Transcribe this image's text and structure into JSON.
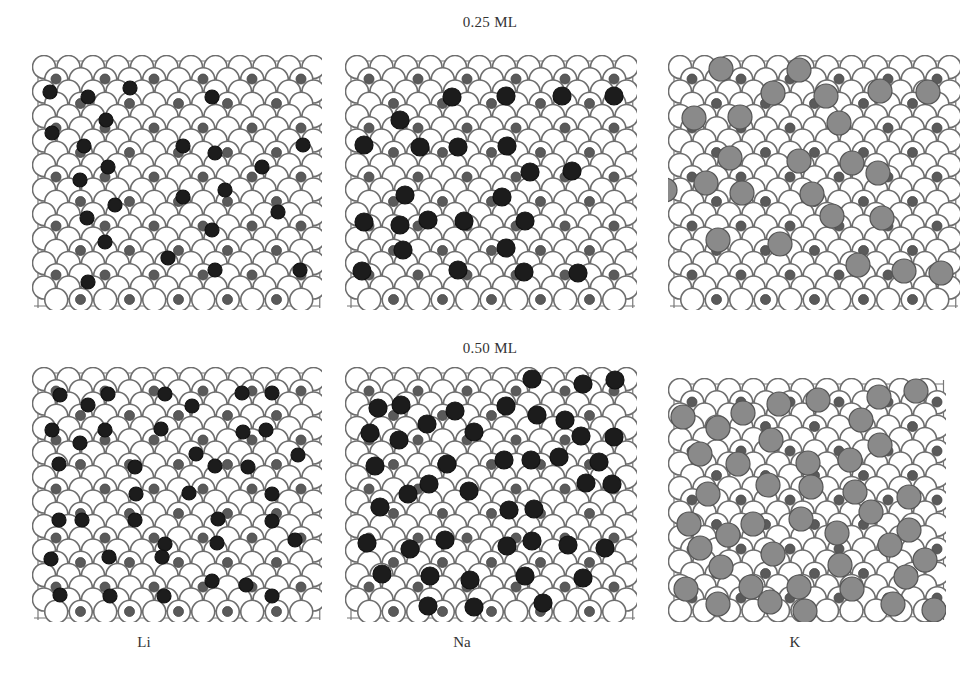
{
  "figure": {
    "rows": [
      {
        "label": "0.25 ML",
        "label_y": 14
      },
      {
        "label": "0.50 ML",
        "label_y": 340
      }
    ],
    "columns": [
      {
        "label": "Li",
        "label_x": 144
      },
      {
        "label": "Na",
        "label_x": 462
      },
      {
        "label": "K",
        "label_x": 795
      }
    ],
    "column_label_y": 634,
    "colors": {
      "substrate_fill": "#ffffff",
      "substrate_stroke": "#6e6e6e",
      "interstitial_fill": "#5a5a5a",
      "li_na_adsorbate": "#1c1c1c",
      "k_adsorbate": "#8a8a8a",
      "k_adsorbate_stroke": "#555555"
    },
    "panels": [
      {
        "id": "li-025",
        "element": "Li",
        "coverage": "0.25 ML",
        "x": 32,
        "y": 55,
        "w": 290,
        "h": 255,
        "ad_r": 7,
        "adsorbates": [
          [
            50,
            92
          ],
          [
            88,
            97
          ],
          [
            106,
            120
          ],
          [
            130,
            88
          ],
          [
            183,
            146
          ],
          [
            212,
            97
          ],
          [
            52,
            133
          ],
          [
            84,
            146
          ],
          [
            108,
            167
          ],
          [
            80,
            180
          ],
          [
            115,
            205
          ],
          [
            183,
            197
          ],
          [
            225,
            190
          ],
          [
            215,
            153
          ],
          [
            262,
            167
          ],
          [
            303,
            145
          ],
          [
            215,
            270
          ],
          [
            87,
            218
          ],
          [
            105,
            242
          ],
          [
            278,
            212
          ],
          [
            88,
            282
          ],
          [
            212,
            230
          ],
          [
            168,
            258
          ],
          [
            300,
            270
          ]
        ]
      },
      {
        "id": "na-025",
        "element": "Na",
        "coverage": "0.25 ML",
        "x": 345,
        "y": 55,
        "w": 292,
        "h": 255,
        "ad_r": 9,
        "adsorbates": [
          [
            452,
            97
          ],
          [
            506,
            96
          ],
          [
            562,
            96
          ],
          [
            614,
            96
          ],
          [
            400,
            120
          ],
          [
            364,
            145
          ],
          [
            420,
            147
          ],
          [
            458,
            147
          ],
          [
            507,
            146
          ],
          [
            530,
            172
          ],
          [
            572,
            171
          ],
          [
            405,
            195
          ],
          [
            502,
            197
          ],
          [
            400,
            225
          ],
          [
            428,
            220
          ],
          [
            464,
            221
          ],
          [
            525,
            221
          ],
          [
            364,
            222
          ],
          [
            403,
            250
          ],
          [
            506,
            248
          ],
          [
            362,
            271
          ],
          [
            458,
            270
          ],
          [
            524,
            272
          ],
          [
            578,
            273
          ]
        ]
      },
      {
        "id": "k-025",
        "element": "K",
        "coverage": "0.25 ML",
        "x": 668,
        "y": 55,
        "w": 292,
        "h": 255,
        "ad_r": 12,
        "adsorbates": [
          [
            721,
            69
          ],
          [
            799,
            70
          ],
          [
            773,
            93
          ],
          [
            826,
            96
          ],
          [
            880,
            91
          ],
          [
            928,
            92
          ],
          [
            694,
            118
          ],
          [
            740,
            117
          ],
          [
            839,
            123
          ],
          [
            730,
            158
          ],
          [
            799,
            161
          ],
          [
            852,
            163
          ],
          [
            706,
            183
          ],
          [
            665,
            190
          ],
          [
            742,
            193
          ],
          [
            812,
            194
          ],
          [
            878,
            173
          ],
          [
            832,
            216
          ],
          [
            882,
            218
          ],
          [
            718,
            240
          ],
          [
            780,
            244
          ],
          [
            858,
            265
          ],
          [
            904,
            271
          ],
          [
            941,
            273
          ]
        ]
      },
      {
        "id": "li-050",
        "element": "Li",
        "coverage": "0.50 ML",
        "x": 32,
        "y": 367,
        "w": 290,
        "h": 255,
        "ad_r": 7,
        "adsorbates": [
          [
            60,
            395
          ],
          [
            108,
            394
          ],
          [
            165,
            394
          ],
          [
            242,
            393
          ],
          [
            52,
            430
          ],
          [
            105,
            430
          ],
          [
            161,
            429
          ],
          [
            192,
            406
          ],
          [
            272,
            393
          ],
          [
            266,
            430
          ],
          [
            298,
            455
          ],
          [
            59,
            464
          ],
          [
            80,
            443
          ],
          [
            135,
            467
          ],
          [
            196,
            454
          ],
          [
            248,
            467
          ],
          [
            136,
            494
          ],
          [
            189,
            493
          ],
          [
            272,
            494
          ],
          [
            59,
            520
          ],
          [
            82,
            520
          ],
          [
            135,
            520
          ],
          [
            165,
            544
          ],
          [
            217,
            543
          ],
          [
            218,
            519
          ],
          [
            272,
            521
          ],
          [
            295,
            540
          ],
          [
            51,
            559
          ],
          [
            109,
            557
          ],
          [
            162,
            557
          ],
          [
            212,
            581
          ],
          [
            246,
            585
          ],
          [
            60,
            595
          ],
          [
            110,
            596
          ],
          [
            164,
            596
          ],
          [
            272,
            596
          ],
          [
            88,
            405
          ],
          [
            215,
            466
          ],
          [
            243,
            432
          ]
        ]
      },
      {
        "id": "na-050",
        "element": "Na",
        "coverage": "0.50 ML",
        "x": 345,
        "y": 367,
        "w": 292,
        "h": 255,
        "ad_r": 9,
        "adsorbates": [
          [
            532,
            379
          ],
          [
            583,
            384
          ],
          [
            615,
            380
          ],
          [
            378,
            408
          ],
          [
            401,
            405
          ],
          [
            455,
            411
          ],
          [
            506,
            406
          ],
          [
            537,
            415
          ],
          [
            565,
            420
          ],
          [
            370,
            433
          ],
          [
            427,
            424
          ],
          [
            474,
            432
          ],
          [
            581,
            436
          ],
          [
            614,
            437
          ],
          [
            375,
            466
          ],
          [
            399,
            440
          ],
          [
            447,
            464
          ],
          [
            504,
            460
          ],
          [
            531,
            460
          ],
          [
            559,
            457
          ],
          [
            599,
            462
          ],
          [
            380,
            507
          ],
          [
            408,
            494
          ],
          [
            429,
            484
          ],
          [
            469,
            491
          ],
          [
            509,
            510
          ],
          [
            534,
            509
          ],
          [
            586,
            483
          ],
          [
            612,
            484
          ],
          [
            367,
            543
          ],
          [
            410,
            549
          ],
          [
            445,
            540
          ],
          [
            507,
            546
          ],
          [
            532,
            541
          ],
          [
            568,
            545
          ],
          [
            605,
            548
          ],
          [
            382,
            574
          ],
          [
            430,
            576
          ],
          [
            470,
            580
          ],
          [
            525,
            576
          ],
          [
            583,
            578
          ],
          [
            428,
            606
          ],
          [
            474,
            607
          ],
          [
            543,
            603
          ]
        ]
      },
      {
        "id": "k-050",
        "element": "K",
        "coverage": "0.50 ML",
        "x": 668,
        "y": 378,
        "w": 278,
        "h": 244,
        "ad_r": 12,
        "adsorbates": [
          [
            683,
            417
          ],
          [
            718,
            428
          ],
          [
            743,
            413
          ],
          [
            779,
            404
          ],
          [
            818,
            400
          ],
          [
            861,
            420
          ],
          [
            879,
            397
          ],
          [
            916,
            391
          ],
          [
            700,
            454
          ],
          [
            738,
            464
          ],
          [
            771,
            440
          ],
          [
            808,
            463
          ],
          [
            850,
            460
          ],
          [
            880,
            445
          ],
          [
            708,
            494
          ],
          [
            768,
            485
          ],
          [
            811,
            487
          ],
          [
            855,
            492
          ],
          [
            909,
            497
          ],
          [
            689,
            524
          ],
          [
            753,
            524
          ],
          [
            801,
            519
          ],
          [
            837,
            533
          ],
          [
            871,
            512
          ],
          [
            909,
            530
          ],
          [
            700,
            548
          ],
          [
            728,
            535
          ],
          [
            773,
            554
          ],
          [
            840,
            565
          ],
          [
            890,
            545
          ],
          [
            925,
            560
          ],
          [
            686,
            589
          ],
          [
            721,
            567
          ],
          [
            751,
            587
          ],
          [
            799,
            587
          ],
          [
            852,
            589
          ],
          [
            906,
            577
          ],
          [
            718,
            604
          ],
          [
            770,
            602
          ],
          [
            805,
            611
          ],
          [
            893,
            604
          ],
          [
            934,
            610
          ]
        ]
      }
    ]
  }
}
